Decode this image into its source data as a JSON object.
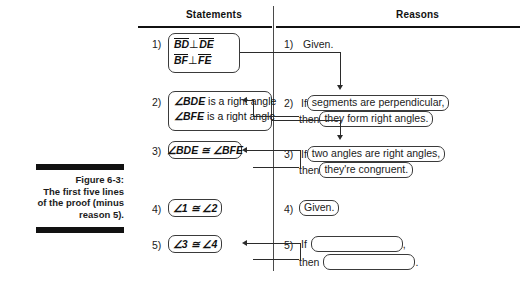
{
  "figure": {
    "caption_title": "Figure 6-3:",
    "caption_body": "The first five lines of the proof (minus reason 5).",
    "background_color": "#ffffff",
    "ink_color": "#111111"
  },
  "columns": {
    "statements_header": "Statements",
    "reasons_header": "Reasons"
  },
  "statements": [
    {
      "number": "1)",
      "lines": [
        "BD ⊥ DE",
        "BF ⊥ FE"
      ],
      "line1_a": "BD",
      "line1_op": "⊥",
      "line1_b": "DE",
      "line2_a": "BF",
      "line2_op": "⊥",
      "line2_b": "FE"
    },
    {
      "number": "2)",
      "lines": [
        "∠BDE is a right angle",
        "∠BFE is a right angle"
      ],
      "line1_angle": "∠BDE",
      "line1_rest": " is a right angle",
      "line2_angle": "∠BFE",
      "line2_rest": " is a right angle"
    },
    {
      "number": "3)",
      "text": "∠BDE ≅ ∠BFE"
    },
    {
      "number": "4)",
      "text": "∠1 ≅ ∠2"
    },
    {
      "number": "5)",
      "text": "∠3 ≅ ∠4"
    }
  ],
  "reasons": [
    {
      "number": "1)",
      "plain": "Given."
    },
    {
      "number": "2)",
      "if_label": "If",
      "if_clause": "segments are perpendicular,",
      "then_label": "then",
      "then_clause": "they form right angles."
    },
    {
      "number": "3)",
      "if_label": "If",
      "if_clause": "two angles are right angles,",
      "then_label": "then",
      "then_clause": "they're congruent."
    },
    {
      "number": "4)",
      "boxed": "Given."
    },
    {
      "number": "5)",
      "if_label": "If",
      "if_clause": "",
      "if_trailing": ",",
      "then_label": "then",
      "then_clause": "",
      "then_trailing": "."
    }
  ]
}
